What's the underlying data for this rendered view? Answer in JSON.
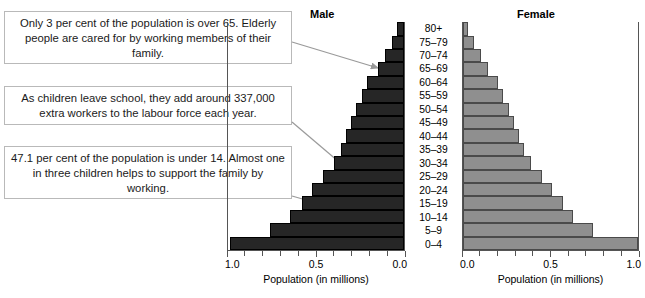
{
  "callouts": [
    {
      "text": "Only 3 per cent of the population is over 65. Elderly people are cared for by working members of their family."
    },
    {
      "text": "As children leave school, they add around 337,000 extra workers to the labour force each year."
    },
    {
      "text": "47.1 per cent of the population is under 14. Almost one in three children helps to support the family by working."
    }
  ],
  "panels": {
    "male_title": "Male",
    "female_title": "Female"
  },
  "axis": {
    "title": "Population (in millions)",
    "male_ticklabels": [
      "1.0",
      "0.5",
      "0.0"
    ],
    "female_ticklabels": [
      "0.0",
      "0.5",
      "1.0"
    ]
  },
  "colors": {
    "male_bar": "#262626",
    "female_bar": "#8f8f8f",
    "axis": "#555555",
    "callout_border": "#b9b9b9",
    "leader_line": "#9a9a9a"
  },
  "chart_data": {
    "type": "bar",
    "subtype": "population-pyramid",
    "xlabel": "Population (in millions)",
    "ylabel": "Age group",
    "xlim": [
      0,
      1.0
    ],
    "grid": false,
    "legend": "none",
    "orientation": "horizontal",
    "categories": [
      "0–4",
      "5–9",
      "10–14",
      "15–19",
      "20–24",
      "25–29",
      "30–34",
      "35–39",
      "40–44",
      "45–49",
      "50–54",
      "55–59",
      "60–64",
      "65–69",
      "70–74",
      "75–79",
      "80+"
    ],
    "series": [
      {
        "name": "Male",
        "direction": "left",
        "values": [
          0.99,
          0.76,
          0.65,
          0.58,
          0.52,
          0.46,
          0.4,
          0.36,
          0.33,
          0.3,
          0.27,
          0.24,
          0.21,
          0.15,
          0.11,
          0.07,
          0.04
        ]
      },
      {
        "name": "Female",
        "direction": "right",
        "values": [
          1.0,
          0.74,
          0.63,
          0.57,
          0.51,
          0.45,
          0.39,
          0.35,
          0.32,
          0.29,
          0.26,
          0.23,
          0.2,
          0.14,
          0.1,
          0.06,
          0.03
        ]
      }
    ]
  }
}
